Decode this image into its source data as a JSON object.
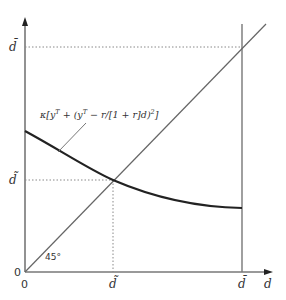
{
  "diagram": {
    "type": "economics-line-diagram",
    "axes": {
      "x_label": "d",
      "y_label": "",
      "origin_x_label": "0",
      "origin_y_label": "0"
    },
    "x_ticks": [
      {
        "label": "d̃",
        "meaning": "d-tilde"
      },
      {
        "label": "d̄",
        "meaning": "d-bar"
      }
    ],
    "y_ticks": [
      {
        "label": "d̄",
        "meaning": "d-bar"
      },
      {
        "label": "d̃",
        "meaning": "d-tilde"
      }
    ],
    "lines": {
      "diagonal": {
        "label": "45°"
      },
      "curve": {
        "label_prefix": "κ[y",
        "label_sup1": "T",
        "label_mid": " + (y",
        "label_sup2": "T",
        "label_tail": " − r/[1 + r]d)",
        "label_sup3": "2",
        "label_end": "]"
      }
    },
    "colors": {
      "axis": "#777777",
      "curve": "#222222",
      "diagonal": "#666666",
      "dotted": "#888888",
      "text": "#333333"
    }
  }
}
